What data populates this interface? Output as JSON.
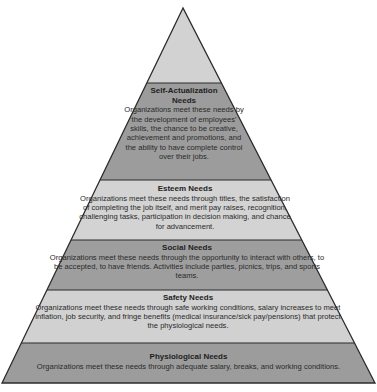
{
  "diagram": {
    "type": "pyramid",
    "colors": {
      "top": "#d2d2d2",
      "dark": "#9c9c9c",
      "light": "#d3d3d3",
      "outline": "#2b2b2b"
    },
    "levels": [
      {
        "title": "Self-Actualization Needs",
        "title_line1": "Self-Actualization",
        "title_line2": "Needs",
        "description": "Organizations meet these needs by the development of employees' skills, the chance to be creative, achievement and promotions, and the ability to have complete control over their jobs."
      },
      {
        "title": "Esteem Needs",
        "description": "Organizations meet these needs through titles, the satisfaction of completing the job itself, and merit pay raises, recognition, challenging tasks, participation in decision making, and chance for advancement."
      },
      {
        "title": "Social Needs",
        "description": "Organizations meet these needs through the opportunity to interact with others, to be accepted, to have friends. Activities include parties, picnics, trips, and sports teams."
      },
      {
        "title": "Safety Needs",
        "description": "Organizations meet these needs through safe working conditions, salary increases to meet inflation, job security, and fringe benefits (medical insurance/sick pay/pensions) that protect the physiological needs."
      },
      {
        "title": "Physiological Needs",
        "description": "Organizations meet these needs through adequate salary, breaks, and working conditions."
      }
    ]
  }
}
